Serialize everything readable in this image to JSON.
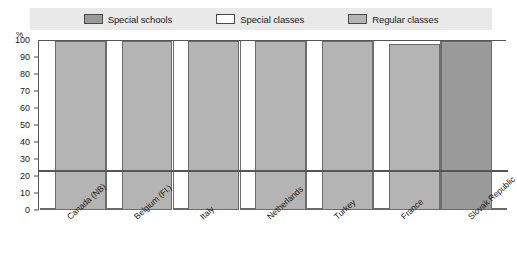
{
  "legend": {
    "items": [
      {
        "label": "Special schools",
        "color": "#9a9a9a",
        "key": "special_schools"
      },
      {
        "label": "Special classes",
        "color": "#fdfdfd",
        "key": "special_classes"
      },
      {
        "label": "Regular classes",
        "color": "#b4b4b4",
        "key": "regular_classes"
      }
    ]
  },
  "axis": {
    "y_unit": "%",
    "y_ticks": [
      "100",
      "90",
      "80",
      "70",
      "60",
      "50",
      "40",
      "30",
      "20",
      "10",
      "0"
    ]
  },
  "caption": "",
  "chart_data": {
    "type": "bar",
    "title": "",
    "xlabel": "",
    "ylabel": "%",
    "ylim": [
      0,
      100
    ],
    "grid": false,
    "legend_position": "top",
    "categories": [
      "Canada (NB)",
      "Belgium (Fl.)",
      "Italy",
      "Netherlands",
      "Turkey",
      "France",
      "Slovak Republic"
    ],
    "series": [
      {
        "name": "Special schools",
        "color": "#9a9a9a",
        "values": [
          0,
          0,
          0,
          0,
          0,
          0,
          100
        ]
      },
      {
        "name": "Special classes",
        "color": "#fdfdfd",
        "values": [
          1,
          1,
          1,
          1,
          1,
          1,
          1
        ]
      },
      {
        "name": "Regular classes",
        "color": "#b4b4b4",
        "values": [
          100,
          100,
          100,
          100,
          100,
          98,
          0
        ]
      }
    ]
  }
}
